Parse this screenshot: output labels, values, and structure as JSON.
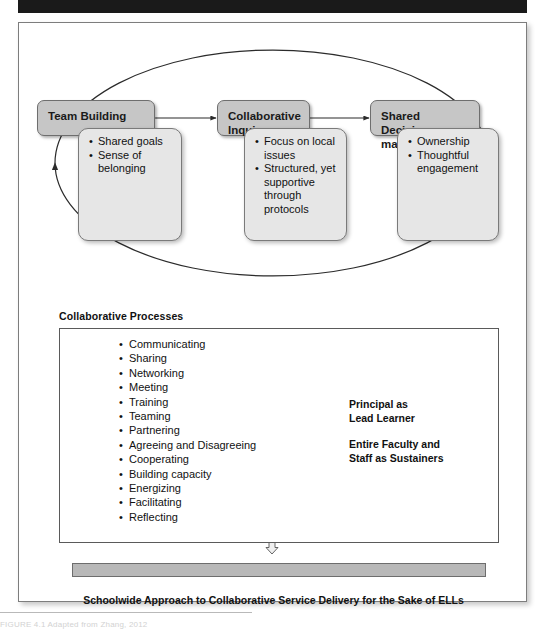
{
  "figure": {
    "cycle": {
      "boxes": [
        {
          "id": "team-building",
          "title": "Team Building",
          "bullets": [
            "Shared goals",
            "Sense of belonging"
          ]
        },
        {
          "id": "collaborative-inquiry",
          "title": "Collaborative Inquiry",
          "bullets": [
            "Focus on local issues",
            "Structured, yet supportive through protocols"
          ]
        },
        {
          "id": "shared-decision-making",
          "title": "Shared Decision-making",
          "bullets": [
            "Ownership",
            "Thoughtful engagement"
          ]
        }
      ]
    },
    "processes": {
      "heading": "Collaborative Processes",
      "items": [
        "Communicating",
        "Sharing",
        "Networking",
        "Meeting",
        "Training",
        "Teaming",
        "Partnering",
        "Agreeing and Disagreeing",
        "Cooperating",
        "Building capacity",
        "Energizing",
        "Facilitating",
        "Reflecting"
      ],
      "roles": [
        "Principal as",
        "Lead Learner",
        "Entire Faculty and",
        "Staff as Sustainers"
      ]
    },
    "outcome": "Schoolwide Approach to Collaborative Service Delivery for the Sake of ELLs",
    "source_note": "FIGURE 4.1  Adapted from Zhang, 2012",
    "colors": {
      "header_bar": "#1a1a1a",
      "box_header_fill": "#c6c6c6",
      "box_body_fill": "#e6e6e6",
      "gray_bar_fill": "#b8b8b8",
      "frame_border": "#7d7d7d"
    }
  }
}
